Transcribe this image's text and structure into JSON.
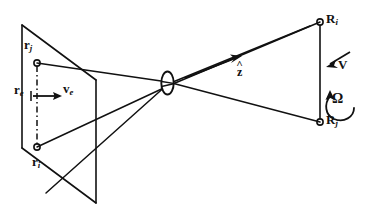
{
  "figure": {
    "name": "optical-ray-diagram",
    "background_color": "#ffffff",
    "line_color": "#111111"
  },
  "object_plane": {
    "name": "left-parallelogram",
    "label_rj": {
      "symbol": "r",
      "subscript": "j"
    },
    "label_re": {
      "symbol": "r",
      "subscript": "e"
    },
    "label_ri": {
      "symbol": "r",
      "subscript": "i"
    },
    "velocity": {
      "symbol": "v",
      "subscript": "e"
    }
  },
  "lens": {
    "name": "lens-element",
    "shape": "vertical-ellipse"
  },
  "axis": {
    "name": "optical-axis",
    "unit_vector": {
      "symbol": "z",
      "accent": "hat"
    }
  },
  "image_plane": {
    "name": "right-image-line",
    "label_Ri": {
      "symbol": "R",
      "subscript": "i"
    },
    "label_Rj": {
      "symbol": "R",
      "subscript": "j"
    }
  },
  "motion": {
    "translation": {
      "symbol": "V"
    },
    "rotation": {
      "symbol": "Ω"
    }
  }
}
